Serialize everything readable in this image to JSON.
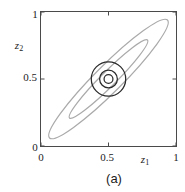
{
  "canvas": {
    "width": 185,
    "height": 192,
    "background": "#ffffff"
  },
  "figure": {
    "caption": "(a)",
    "x_axis": {
      "label_letter": "z",
      "label_sub": "1",
      "ticks": [
        "0",
        "0.5",
        "1"
      ]
    },
    "y_axis": {
      "label_letter": "z",
      "label_sub": "2",
      "ticks": [
        "0",
        "0.5",
        "1"
      ]
    }
  },
  "chart_data": {
    "type": "contour",
    "title": "",
    "xlabel": "z1",
    "ylabel": "z2",
    "xlim": [
      0,
      1
    ],
    "ylim": [
      0,
      1
    ],
    "x_ticks": [
      0,
      0.5,
      1
    ],
    "y_ticks": [
      0,
      0.5,
      1
    ],
    "grid": false,
    "legend": "none",
    "center": [
      0.5,
      0.5
    ],
    "gray_ellipses": [
      {
        "cx": 0.5,
        "cy": 0.5,
        "semi_major": 0.62,
        "semi_minor": 0.1,
        "angle_deg": 45
      },
      {
        "cx": 0.5,
        "cy": 0.5,
        "semi_major": 0.41,
        "semi_minor": 0.055,
        "angle_deg": 45
      }
    ],
    "black_circles": [
      {
        "cx": 0.5,
        "cy": 0.5,
        "r": 0.128
      },
      {
        "cx": 0.5,
        "cy": 0.5,
        "r": 0.066
      },
      {
        "cx": 0.5,
        "cy": 0.5,
        "r": 0.033
      }
    ],
    "colors": {
      "ellipse": "#aaaaaa",
      "circle": "#2b2b2b",
      "frame": "#4a4a4a",
      "text": "#1c1c1c"
    }
  }
}
